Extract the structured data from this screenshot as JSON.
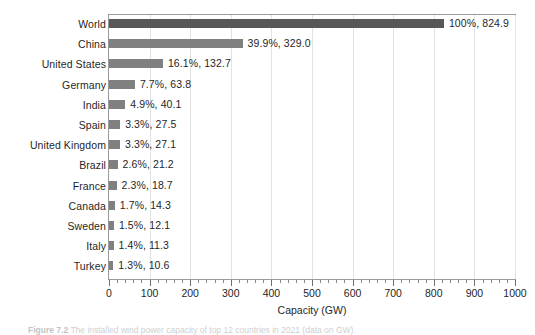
{
  "figure": {
    "caption_label": "Figure 7.2",
    "caption_text": "The installed wind power capacity of top 12 countries in 2021 (data on GW)."
  },
  "chart_data": {
    "type": "bar",
    "orientation": "horizontal",
    "title": "",
    "xlabel": "Capacity (GW)",
    "ylabel": "",
    "xlim": [
      0,
      1000
    ],
    "xticks": [
      0,
      100,
      200,
      300,
      400,
      500,
      600,
      700,
      800,
      900,
      1000
    ],
    "xtick_labels": [
      "0",
      "100",
      "200",
      "300",
      "400",
      "500",
      "600",
      "700",
      "800",
      "900",
      "1000"
    ],
    "minor_tick_interval": 20,
    "grid": true,
    "legend": false,
    "bar_color": "#808080",
    "total_bar_color": "#575757",
    "categories": [
      "World",
      "China",
      "United States",
      "Germany",
      "India",
      "Spain",
      "United Kingdom",
      "Brazil",
      "France",
      "Canada",
      "Sweden",
      "Italy",
      "Turkey"
    ],
    "values": [
      824.9,
      329.0,
      132.7,
      63.8,
      40.1,
      27.5,
      27.1,
      21.2,
      18.7,
      14.3,
      12.1,
      11.3,
      10.6
    ],
    "percents": [
      "100%",
      "39.9%",
      "16.1%",
      "7.7%",
      "4.9%",
      "3.3%",
      "3.3%",
      "2.6%",
      "2.3%",
      "1.7%",
      "1.5%",
      "1.4%",
      "1.3%"
    ],
    "data_labels": [
      "100%, 824.9",
      "39.9%, 329.0",
      "16.1%, 132.7",
      "7.7%, 63.8",
      "4.9%, 40.1",
      "3.3%, 27.5",
      "3.3%, 27.1",
      "2.6%, 21.2",
      "2.3%, 18.7",
      "1.7%, 14.3",
      "1.5%, 12.1",
      "1.4%, 11.3",
      "1.3%, 10.6"
    ]
  }
}
